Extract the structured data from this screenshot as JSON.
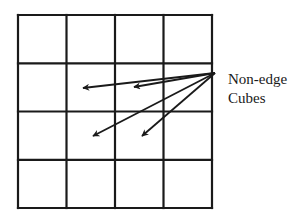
{
  "diagram": {
    "grid": {
      "rows": 4,
      "cols": 4,
      "x_lines": [
        18,
        66.5,
        115,
        163.5,
        212
      ],
      "y_lines": [
        15,
        63.3,
        111.5,
        159.8,
        208
      ],
      "stroke_color": "#1a1a1a",
      "stroke_width": 2.2
    },
    "arrows": {
      "origin": [
        215,
        73
      ],
      "color": "#1a1a1a",
      "targets": [
        {
          "cell": "row2-col2",
          "tip": [
            83,
            88
          ]
        },
        {
          "cell": "row2-col3",
          "tip": [
            134,
            87
          ]
        },
        {
          "cell": "row3-col2",
          "tip": [
            93,
            136
          ]
        },
        {
          "cell": "row3-col3",
          "tip": [
            142,
            136
          ]
        }
      ]
    },
    "label": {
      "lines": [
        "Non-edge",
        "Cubes"
      ]
    }
  }
}
